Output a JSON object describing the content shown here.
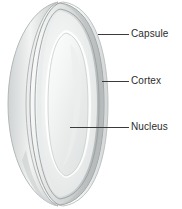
{
  "figure": {
    "background_color": "#ffffff",
    "width": 182,
    "height": 209,
    "structure": {
      "subject": "eye-lens",
      "view": "three-quarter cutaway",
      "layers": [
        {
          "name": "Capsule",
          "role": "outer thin membrane rim",
          "color": "#b8bcbd"
        },
        {
          "name": "Cortex",
          "role": "middle layer between capsule and nucleus",
          "color": "#e3e5e6"
        },
        {
          "name": "Nucleus",
          "role": "central core of the lens",
          "color": "#f2f3f3"
        }
      ]
    },
    "line_color": "#3a3a3a",
    "text_color": "#2b2b2b"
  },
  "labels": [
    {
      "id": "capsule",
      "text": "Capsule",
      "leader_from_x": 98,
      "leader_from_y": 34,
      "leader_to_x": 129,
      "leader_to_y": 34
    },
    {
      "id": "cortex",
      "text": "Cortex",
      "leader_from_x": 102,
      "leader_from_y": 81,
      "leader_to_x": 129,
      "leader_to_y": 81
    },
    {
      "id": "nucleus",
      "text": "Nucleus",
      "leader_from_x": 70,
      "leader_from_y": 127,
      "leader_to_x": 129,
      "leader_to_y": 127
    }
  ]
}
